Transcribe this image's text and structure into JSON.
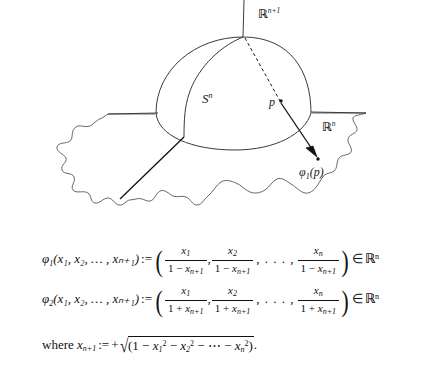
{
  "figure": {
    "title_context": "stereographic-projection-diagram",
    "labels": {
      "ambient_space": "ℝn+1",
      "ambient_space_base": "ℝ",
      "ambient_space_exp": "n+1",
      "sphere_base": "S",
      "sphere_exp": "n",
      "plane_base": "ℝ",
      "plane_exp": "n",
      "point": "p",
      "image_point": "φ₁(p)",
      "image_point_base": "φ",
      "image_point_sub": "1",
      "image_point_arg": "(p)"
    },
    "colors": {
      "stroke": "#3a3a3a",
      "stroke_dark": "#111111",
      "text": "#1a1a1a",
      "background": "#ffffff"
    },
    "elements": [
      "vertical-axis",
      "dome-outline",
      "equator-curve",
      "meridian-curve",
      "plane-outline",
      "plane-horizontal-left",
      "plane-horizontal-right",
      "dashed-ray",
      "projection-arrow",
      "chord-line",
      "point-p-marker",
      "image-point-marker"
    ]
  },
  "equations": {
    "eq1": {
      "lhs_fn": "φ",
      "lhs_sub": "1",
      "args": "(x₁, x₂, … , xₙ₊₁)",
      "assign": ":=",
      "numerators": [
        "x",
        "x",
        "x"
      ],
      "numerator_subs": [
        "1",
        "2",
        "n"
      ],
      "denominator_lead": "1",
      "denominator_op": "−",
      "denominator_var": "x",
      "denominator_sub": "n+1",
      "membership": "∈",
      "codomain_base": "ℝ",
      "codomain_exp": "n"
    },
    "eq2": {
      "lhs_fn": "φ",
      "lhs_sub": "2",
      "args": "(x₁, x₂, … , xₙ₊₁)",
      "assign": ":=",
      "numerators": [
        "x",
        "x",
        "x"
      ],
      "numerator_subs": [
        "1",
        "2",
        "n"
      ],
      "denominator_lead": "1",
      "denominator_op": "+",
      "denominator_var": "x",
      "denominator_sub": "n+1",
      "membership": "∈",
      "codomain_base": "ℝ",
      "codomain_exp": "n"
    },
    "eq3": {
      "where_word": "where",
      "lhs_var": "x",
      "lhs_sub": "n+1",
      "assign": ":=",
      "sign": "+",
      "radical_sign": "√",
      "body_open": "(1",
      "terms": [
        "x",
        "x",
        "x"
      ],
      "term_subs": [
        "1",
        "2",
        "n"
      ],
      "term_exp": "2",
      "minus": "−",
      "dots": "⋯",
      "body_close": ")",
      "period": "."
    }
  }
}
